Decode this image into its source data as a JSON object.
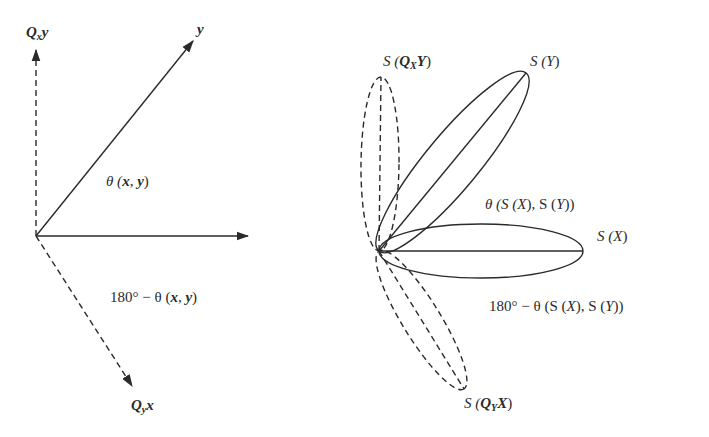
{
  "left_diagram": {
    "labels": {
      "qxy_base": "Q",
      "qxy_sub": "x",
      "qxy_vec": "y",
      "y": "y",
      "theta": "θ (x, y)",
      "theta_sym": "θ (",
      "theta_x": "x",
      "theta_comma": ", ",
      "theta_y": "y",
      "theta_close": ")",
      "supp_prefix": "180°  − θ (",
      "supp_x": "x",
      "supp_comma": ", ",
      "supp_y": "y",
      "supp_close": ")",
      "qyx_base": "Q",
      "qyx_sub": "y",
      "qyx_vec": "x"
    },
    "vectors": [
      {
        "name": "x",
        "style": "solid",
        "from": [
          36,
          236
        ],
        "to": [
          248,
          236
        ]
      },
      {
        "name": "y",
        "style": "solid",
        "from": [
          36,
          236
        ],
        "to": [
          193,
          40
        ]
      },
      {
        "name": "Q_x y",
        "style": "dashed",
        "from": [
          36,
          236
        ],
        "to": [
          36,
          50
        ]
      },
      {
        "name": "Q_y x",
        "style": "dashed",
        "from": [
          36,
          236
        ],
        "to": [
          132,
          387
        ]
      }
    ]
  },
  "right_diagram": {
    "labels": {
      "sqxy_pre": "S (",
      "sqxy_base": "Q",
      "sqxy_sub": "X",
      "sqxy_vec": "Y",
      "sqxy_close": ")",
      "sy": "S (Y)",
      "sy_pre": "S (",
      "sy_vec": "Y",
      "sy_close": ")",
      "theta_pre": "θ (S (",
      "theta_x": "X",
      "theta_mid": "), S (",
      "theta_y": "Y",
      "theta_close": "))",
      "sx_pre": "S (",
      "sx_vec": "X",
      "sx_close": ")",
      "supp_pre": "180°  − θ (S (",
      "supp_x": "X",
      "supp_mid": "), S (",
      "supp_y": "Y",
      "supp_close": "))",
      "sqyx_pre": "S (",
      "sqyx_base": "Q",
      "sqyx_sub": "Y",
      "sqyx_vec": "X",
      "sqyx_close": ")"
    },
    "ellipses": [
      {
        "name": "S(Y)",
        "style": "solid",
        "from": [
          379,
          251
        ],
        "to": [
          526,
          73
        ]
      },
      {
        "name": "S(X)",
        "style": "solid",
        "from": [
          379,
          251
        ],
        "to": [
          583,
          251
        ]
      },
      {
        "name": "S(Q_X Y)",
        "style": "dashed",
        "from": [
          379,
          251
        ],
        "to": [
          381,
          77
        ]
      },
      {
        "name": "S(Q_Y X)",
        "style": "dashed",
        "from": [
          379,
          251
        ],
        "to": [
          464,
          389
        ]
      }
    ]
  },
  "colors": {
    "line": "#2a2a2a",
    "background": "#ffffff"
  }
}
